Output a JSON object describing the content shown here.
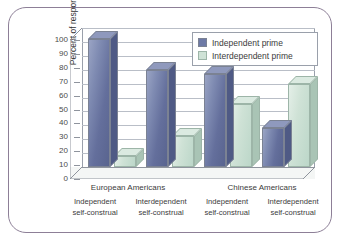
{
  "chart_data": {
    "type": "bar",
    "title": "",
    "xlabel": "",
    "ylabel": "Percent of responses",
    "ylim": [
      0,
      100
    ],
    "ytick_step": 10,
    "yticks": [
      "100",
      "90",
      "80",
      "70",
      "60",
      "50",
      "40",
      "30",
      "20",
      "10",
      "0"
    ],
    "grid": true,
    "legend_position": "top-right",
    "group_headers": [
      "European Americans",
      "Chinese Americans"
    ],
    "categories": [
      "Independent self-construal",
      "Interdependent self-construal",
      "Independent self-construal",
      "Interdependent self-construal"
    ],
    "category_lines": [
      {
        "line1": "Independent",
        "line2": "self-construal"
      },
      {
        "line1": "Interdependent",
        "line2": "self-construal"
      },
      {
        "line1": "Independent",
        "line2": "self-construal"
      },
      {
        "line1": "Interdependent",
        "line2": "self-construal"
      }
    ],
    "series": [
      {
        "name": "Independent prime",
        "color": "#6e7aa6",
        "values": [
          92,
          70,
          67,
          28
        ]
      },
      {
        "name": "Interdependent prime",
        "color": "#cfe2d6",
        "values": [
          8,
          22,
          45,
          60
        ]
      }
    ]
  },
  "legend": {
    "items": [
      {
        "label": "Independent prime"
      },
      {
        "label": "Interdependent prime"
      }
    ]
  },
  "colors": {
    "frame_border": "#8d7f97",
    "axis_line": "#8f949d",
    "gridline": "#b9bec7",
    "series_blue": "#6e7aa6",
    "series_green": "#cfe2d6",
    "background": "#ffffff"
  }
}
